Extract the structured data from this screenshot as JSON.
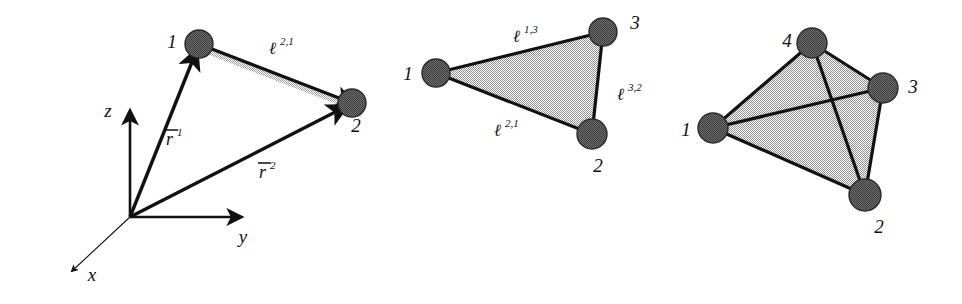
{
  "figure": {
    "background_color": "#ffffff",
    "ink_color": "#111111",
    "node_fill_color": "#8a8a8a",
    "face_fill_color": "#b9b9b9",
    "panels": [
      {
        "id": "panel-position-vectors",
        "name": "two-node-position-vector-diagram",
        "axes": [
          {
            "name": "z",
            "label": "z",
            "style": "solid"
          },
          {
            "name": "y",
            "label": "y",
            "style": "solid"
          },
          {
            "name": "x",
            "label": "x",
            "style": "thin"
          }
        ],
        "nodes": [
          {
            "id": "1",
            "label": "1",
            "cx": 199,
            "cy": 44,
            "r": 14
          },
          {
            "id": "2",
            "label": "2",
            "cx": 352,
            "cy": 103,
            "r": 14
          }
        ],
        "vectors": [
          {
            "name": "r1",
            "base": "r",
            "accent": "bar",
            "superscript": "1",
            "from": "origin",
            "to": "1"
          },
          {
            "name": "r2",
            "base": "r",
            "accent": "bar",
            "superscript": "2",
            "from": "origin",
            "to": "2"
          }
        ],
        "edges": [
          {
            "name": "ell-2-1",
            "base": "ℓ",
            "superscript": "2,1",
            "from": "1",
            "to": "2"
          }
        ],
        "origin": {
          "x": 130,
          "y": 217
        }
      },
      {
        "id": "panel-triangle",
        "name": "triangular-element",
        "nodes": [
          {
            "id": "1",
            "label": "1",
            "cx": 436,
            "cy": 73,
            "r": 14
          },
          {
            "id": "2",
            "label": "2",
            "cx": 592,
            "cy": 134,
            "r": 15
          },
          {
            "id": "3",
            "label": "3",
            "cx": 603,
            "cy": 32,
            "r": 14
          }
        ],
        "edges": [
          {
            "name": "ell-1-3",
            "base": "ℓ",
            "superscript": "1,3",
            "from": "1",
            "to": "3"
          },
          {
            "name": "ell-3-2",
            "base": "ℓ",
            "superscript": "3,2",
            "from": "3",
            "to": "2"
          },
          {
            "name": "ell-2-1",
            "base": "ℓ",
            "superscript": "2,1",
            "from": "2",
            "to": "1"
          }
        ]
      },
      {
        "id": "panel-tetrahedron",
        "name": "tetrahedral-element",
        "nodes": [
          {
            "id": "1",
            "label": "1",
            "cx": 713,
            "cy": 128,
            "r": 15
          },
          {
            "id": "2",
            "label": "2",
            "cx": 865,
            "cy": 195,
            "r": 16
          },
          {
            "id": "3",
            "label": "3",
            "cx": 883,
            "cy": 88,
            "r": 15
          },
          {
            "id": "4",
            "label": "4",
            "cx": 812,
            "cy": 43,
            "r": 15
          }
        ],
        "edges": [
          {
            "name": "edge-1-4",
            "from": "1",
            "to": "4"
          },
          {
            "name": "edge-1-3",
            "from": "1",
            "to": "3"
          },
          {
            "name": "edge-1-2",
            "from": "1",
            "to": "2"
          },
          {
            "name": "edge-4-3",
            "from": "4",
            "to": "3"
          },
          {
            "name": "edge-4-2",
            "from": "4",
            "to": "2"
          },
          {
            "name": "edge-3-2",
            "from": "3",
            "to": "2"
          }
        ]
      }
    ]
  },
  "labels": {
    "panel1": {
      "node1": "1",
      "node2": "2",
      "axis_z": "z",
      "axis_y": "y",
      "axis_x": "x",
      "vec_r1_base": "r",
      "vec_r1_sup": "1",
      "vec_r2_base": "r",
      "vec_r2_sup": "2",
      "edge_base": "ℓ",
      "edge_sup": "2,1"
    },
    "panel2": {
      "node1": "1",
      "node2": "2",
      "node3": "3",
      "edge13_base": "ℓ",
      "edge13_sup": "1,3",
      "edge32_base": "ℓ",
      "edge32_sup": "3,2",
      "edge21_base": "ℓ",
      "edge21_sup": "2,1"
    },
    "panel3": {
      "node1": "1",
      "node2": "2",
      "node3": "3",
      "node4": "4"
    }
  }
}
